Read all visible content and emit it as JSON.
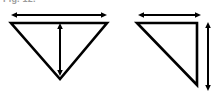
{
  "figure": {
    "caption": "Fig. 12.",
    "background_color": "#ffffff",
    "stroke_color": "#000000",
    "width": 217,
    "height": 95
  },
  "shapes": [
    {
      "name": "inverted-triangle",
      "label": "left-figure",
      "description": "Downward-pointing isosceles triangle",
      "points": "11,23 107,23 60,79",
      "stroke_width": 2.6
    },
    {
      "name": "right-triangle",
      "label": "right-figure",
      "description": "Right triangle with right angle at top-right corner",
      "points": "137,23 197,23 197,85",
      "stroke_width": 2.6
    }
  ],
  "arrows": [
    {
      "name": "left-horizontal-dimension-arrow",
      "orientation": "horizontal",
      "double_headed": true,
      "x1": 17,
      "y1": 15,
      "x2": 101,
      "y2": 15,
      "stroke_width": 2.0
    },
    {
      "name": "left-vertical-dimension-arrow",
      "orientation": "vertical",
      "double_headed": true,
      "x1": 60,
      "y1": 29,
      "x2": 60,
      "y2": 70,
      "stroke_width": 2.0
    },
    {
      "name": "right-horizontal-dimension-arrow",
      "orientation": "horizontal",
      "double_headed": true,
      "x1": 144,
      "y1": 15,
      "x2": 195,
      "y2": 15,
      "stroke_width": 2.0
    },
    {
      "name": "right-vertical-dimension-arrow",
      "orientation": "vertical",
      "double_headed": true,
      "x1": 208,
      "y1": 28,
      "x2": 208,
      "y2": 85,
      "stroke_width": 2.0
    }
  ]
}
